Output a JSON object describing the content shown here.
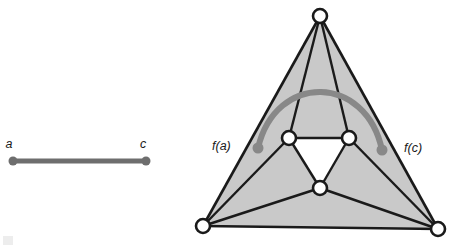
{
  "figure": {
    "canvas": {
      "width": 453,
      "height": 247,
      "background": "#ffffff"
    },
    "colors": {
      "edge_stroke": "#1a1a1a",
      "face_fill": "#c9c9c9",
      "inner_face_fill": "#ffffff",
      "vertex_fill": "#ffffff",
      "vertex_stroke": "#1a1a1a",
      "path_gray": "#888888",
      "segment_gray": "#6e6e6e",
      "label_color": "#1a1a1a"
    },
    "left_panel": {
      "name": "edge-ac",
      "segment": {
        "x1": 13,
        "y1": 161,
        "x2": 146,
        "y2": 161
      },
      "endpoints": [
        {
          "label": "a",
          "cx": 13,
          "cy": 161,
          "r": 4.5,
          "label_x": 9,
          "label_y": 148
        },
        {
          "label": "c",
          "cx": 146,
          "cy": 161,
          "r": 4.5,
          "label_x": 142,
          "label_y": 148
        }
      ],
      "labels": {
        "a": "a",
        "c": "c"
      }
    },
    "right_panel": {
      "name": "image-triangulation",
      "outer_vertices": [
        {
          "id": "top",
          "cx": 320,
          "cy": 16,
          "r": 7
        },
        {
          "id": "bottom-left",
          "cx": 203,
          "cy": 226,
          "r": 7
        },
        {
          "id": "bottom-right",
          "cx": 438,
          "cy": 229,
          "r": 7
        }
      ],
      "inner_vertices": [
        {
          "id": "inner-left",
          "cx": 289,
          "cy": 138,
          "r": 7
        },
        {
          "id": "inner-right",
          "cx": 349,
          "cy": 138,
          "r": 7
        },
        {
          "id": "inner-bottom",
          "cx": 320,
          "cy": 188,
          "r": 7
        }
      ],
      "edges": [
        {
          "from": "top",
          "to": "bottom-left"
        },
        {
          "from": "top",
          "to": "bottom-right"
        },
        {
          "from": "bottom-left",
          "to": "bottom-right"
        },
        {
          "from": "top",
          "to": "inner-left"
        },
        {
          "from": "top",
          "to": "inner-right"
        },
        {
          "from": "bottom-left",
          "to": "inner-left"
        },
        {
          "from": "bottom-left",
          "to": "inner-bottom"
        },
        {
          "from": "bottom-right",
          "to": "inner-right"
        },
        {
          "from": "bottom-right",
          "to": "inner-bottom"
        },
        {
          "from": "inner-left",
          "to": "inner-right"
        },
        {
          "from": "inner-left",
          "to": "inner-bottom"
        },
        {
          "from": "inner-right",
          "to": "inner-bottom"
        }
      ],
      "image_path": {
        "name": "gray-arc-f-of-edge",
        "start": {
          "cx": 258,
          "cy": 148,
          "r": 5.5
        },
        "end": {
          "cx": 382,
          "cy": 150,
          "r": 5.5
        },
        "control1": {
          "x": 276,
          "y": 72
        },
        "control2": {
          "x": 366,
          "y": 74
        },
        "stroke_width": 6
      },
      "labels": {
        "f_a": {
          "text": "f(a)",
          "x": 212,
          "y": 150
        },
        "f_c": {
          "text": "f(c)",
          "x": 404,
          "y": 152
        }
      }
    }
  }
}
